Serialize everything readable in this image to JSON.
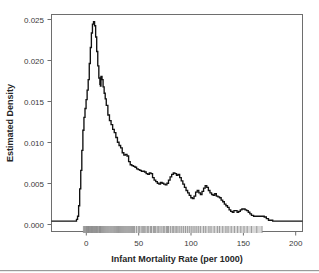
{
  "chart_data": {
    "type": "line",
    "title": "",
    "subtitle": "",
    "xlabel": "Infant Mortality Rate (per 1000)",
    "ylabel": "Estimated Density",
    "xlim": [
      -28,
      208
    ],
    "ylim": [
      -0.0013,
      0.0257
    ],
    "xticks": [
      0,
      50,
      100,
      150,
      200
    ],
    "xticklabels": [
      "0",
      "50",
      "100",
      "150",
      "200"
    ],
    "yticks": [
      0.0,
      0.005,
      0.01,
      0.015,
      0.02,
      0.025
    ],
    "yticklabels": [
      "0.000",
      "0.005",
      "0.010",
      "0.015",
      "0.020",
      "0.025"
    ],
    "grid": false,
    "legend": null,
    "series": [
      {
        "name": "Estimated Density",
        "color": "#111111",
        "style": "step-like kernel density estimate",
        "x": [
          -28,
          -10,
          -6,
          -4.5,
          -3.5,
          -2.5,
          -1.5,
          -0.5,
          0.5,
          1.5,
          2.5,
          3.5,
          4.5,
          5.5,
          6.5,
          7.5,
          8.5,
          9.5,
          10.5,
          11.5,
          12.5,
          13.5,
          14.5,
          15.5,
          16.5,
          17.5,
          18.0,
          18.5,
          19.5,
          20.5,
          21.5,
          22.5,
          23.5,
          25.0,
          26.5,
          28.0,
          29.5,
          31.0,
          32.5,
          34.0,
          35.5,
          37.0,
          38.5,
          40.0,
          41.5,
          43.0,
          44.5,
          46.0,
          47.5,
          49.0,
          50.5,
          52.0,
          53.5,
          55.0,
          56.5,
          58.0,
          59.5,
          61.0,
          62.5,
          64.0,
          65.5,
          67.0,
          68.5,
          70.0,
          71.5,
          73.0,
          74.5,
          76.0,
          77.5,
          79.0,
          80.5,
          82.0,
          83.5,
          85.0,
          86.5,
          88.0,
          89.5,
          91.0,
          92.5,
          94.0,
          95.5,
          97.0,
          98.5,
          100.0,
          101.5,
          103.0,
          104.5,
          106.0,
          107.5,
          109.0,
          110.5,
          112.0,
          113.5,
          115.0,
          116.5,
          118.0,
          119.5,
          121.0,
          122.5,
          124.0,
          125.5,
          127.0,
          128.5,
          130.0,
          131.5,
          133.0,
          134.5,
          136.0,
          137.5,
          139.0,
          140.5,
          142.0,
          143.5,
          145.0,
          146.5,
          148.0,
          149.5,
          151.0,
          152.5,
          154.0,
          155.5,
          157.0,
          158.5,
          160.0,
          162.0,
          164.0,
          166.0,
          168.0,
          170.0,
          172.0,
          174.0,
          176.0,
          180.0,
          190.0,
          200.0,
          208.0
        ],
        "y": [
          0.0,
          0.0,
          0.0,
          0.0002,
          0.0006,
          0.0019,
          0.004,
          0.0063,
          0.0088,
          0.0113,
          0.0129,
          0.014,
          0.0151,
          0.0163,
          0.0176,
          0.0196,
          0.0216,
          0.0234,
          0.0245,
          0.0248,
          0.0243,
          0.0229,
          0.0211,
          0.0193,
          0.0178,
          0.017,
          0.0168,
          0.018,
          0.0176,
          0.0167,
          0.0159,
          0.0152,
          0.0144,
          0.0132,
          0.0125,
          0.012,
          0.0114,
          0.011,
          0.0104,
          0.0098,
          0.0094,
          0.0091,
          0.0085,
          0.0082,
          0.0083,
          0.0081,
          0.0074,
          0.007,
          0.0069,
          0.0068,
          0.0067,
          0.0065,
          0.0064,
          0.0063,
          0.0062,
          0.0062,
          0.0061,
          0.0059,
          0.0058,
          0.006,
          0.0059,
          0.0054,
          0.0051,
          0.0049,
          0.0047,
          0.0046,
          0.0048,
          0.0047,
          0.0046,
          0.0045,
          0.0047,
          0.0051,
          0.0055,
          0.0058,
          0.006,
          0.0059,
          0.0057,
          0.0058,
          0.0054,
          0.005,
          0.0046,
          0.0042,
          0.0038,
          0.0035,
          0.0032,
          0.0029,
          0.0028,
          0.0031,
          0.0036,
          0.0038,
          0.0035,
          0.0033,
          0.0037,
          0.0041,
          0.0044,
          0.0042,
          0.0038,
          0.0035,
          0.0033,
          0.0032,
          0.0034,
          0.0031,
          0.003,
          0.0029,
          0.0026,
          0.0024,
          0.0021,
          0.0019,
          0.0017,
          0.0014,
          0.0012,
          0.0011,
          0.0013,
          0.0013,
          0.0011,
          0.0012,
          0.0014,
          0.0015,
          0.0015,
          0.0014,
          0.0013,
          0.0011,
          0.0009,
          0.0007,
          0.0006,
          0.0006,
          0.0006,
          0.0006,
          0.0006,
          0.0005,
          0.0003,
          0.0001,
          0.0,
          0.0,
          0.0,
          0.0
        ]
      }
    ],
    "rug": {
      "name": "data-rug",
      "description": "rug plot of observed infant mortality rates along the x-axis baseline",
      "color": "#8a8a8a",
      "band_color": "#d8d8d8",
      "values": [
        2,
        3,
        4,
        5,
        5,
        6,
        6,
        7,
        7,
        7,
        8,
        8,
        9,
        9,
        10,
        10,
        10,
        11,
        11,
        12,
        12,
        13,
        13,
        14,
        14,
        15,
        15,
        16,
        17,
        17,
        18,
        18,
        19,
        20,
        21,
        22,
        23,
        24,
        25,
        26,
        27,
        28,
        29,
        30,
        31,
        32,
        33,
        34,
        35,
        36,
        37,
        38,
        39,
        40,
        41,
        42,
        43,
        44,
        45,
        46,
        47,
        48,
        49,
        50,
        52,
        54,
        55,
        57,
        58,
        59,
        60,
        62,
        63,
        65,
        66,
        68,
        69,
        70,
        72,
        73,
        75,
        77,
        78,
        80,
        81,
        82,
        84,
        86,
        87,
        89,
        90,
        92,
        94,
        96,
        98,
        100,
        102,
        104,
        106,
        108,
        110,
        112,
        115,
        117,
        120,
        122,
        125,
        128,
        130,
        133,
        136,
        138,
        141,
        144,
        147,
        150,
        153,
        156,
        160,
        165,
        170
      ]
    }
  },
  "axes": {
    "x_axis_name": "infant-mortality-rate-axis",
    "y_axis_name": "estimated-density-axis"
  }
}
